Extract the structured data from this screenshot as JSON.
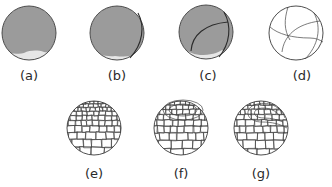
{
  "figure": {
    "panels": [
      {
        "id": "a",
        "label": "(a)",
        "description": "gray sphere, light crescent at bottom"
      },
      {
        "id": "b",
        "label": "(b)",
        "description": "gray sphere with first cleavage furrow"
      },
      {
        "id": "c",
        "label": "(c)",
        "description": "gray sphere with two cleavage furrows"
      },
      {
        "id": "d",
        "label": "(d)",
        "description": "white sphere outline with furrows"
      },
      {
        "id": "e",
        "label": "(e)",
        "description": "blastula with many cells"
      },
      {
        "id": "f",
        "label": "(f)",
        "description": "blastula with circular blastopore"
      },
      {
        "id": "g",
        "label": "(g)",
        "description": "gastrula with invagination"
      }
    ],
    "colors": {
      "sphere_fill": "#9b9b9b",
      "crescent_fill": "#e6e6e6",
      "line": "#333333",
      "background": "#ffffff"
    }
  }
}
